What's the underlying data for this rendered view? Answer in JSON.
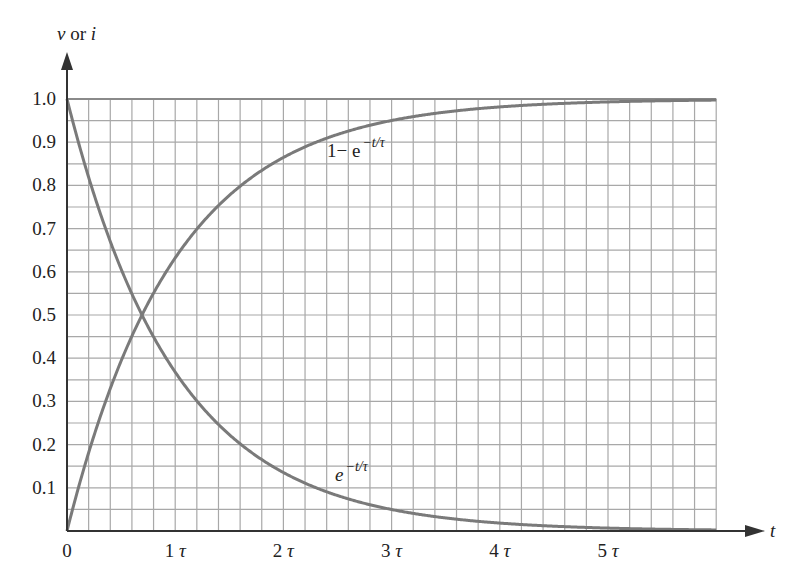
{
  "chart_data": {
    "type": "line",
    "title": "",
    "xlabel": "t",
    "ylabel": "v or i",
    "ylabel_parts": {
      "v": "v",
      "or": " or ",
      "i": "i"
    },
    "xlim": [
      0,
      6
    ],
    "ylim": [
      0,
      1.0
    ],
    "grid": true,
    "grid_x_step": 0.2,
    "grid_y_step": 0.05,
    "x_ticks": [
      {
        "value": 0,
        "label": "0"
      },
      {
        "value": 1,
        "label": "1τ",
        "num": "1",
        "sym": "τ"
      },
      {
        "value": 2,
        "label": "2τ",
        "num": "2",
        "sym": "τ"
      },
      {
        "value": 3,
        "label": "3τ",
        "num": "3",
        "sym": "τ"
      },
      {
        "value": 4,
        "label": "4τ",
        "num": "4",
        "sym": "τ"
      },
      {
        "value": 5,
        "label": "5τ",
        "num": "5",
        "sym": "τ"
      }
    ],
    "y_ticks": [
      {
        "value": 1.0,
        "label": "1.0"
      },
      {
        "value": 0.9,
        "label": "0.9"
      },
      {
        "value": 0.8,
        "label": "0.8"
      },
      {
        "value": 0.7,
        "label": "0.7"
      },
      {
        "value": 0.6,
        "label": "0.6"
      },
      {
        "value": 0.5,
        "label": "0.5"
      },
      {
        "value": 0.4,
        "label": "0.4"
      },
      {
        "value": 0.3,
        "label": "0.3"
      },
      {
        "value": 0.2,
        "label": "0.2"
      },
      {
        "value": 0.1,
        "label": "0.1"
      }
    ],
    "x": [
      0,
      0.5,
      1,
      1.5,
      2,
      2.5,
      3,
      3.5,
      4,
      4.5,
      5,
      5.5,
      6
    ],
    "series": [
      {
        "name": "1 − e^(−t/τ)",
        "label_base": "1− e",
        "label_exp": "−t/τ",
        "formula": "rise",
        "values": [
          0,
          0.393,
          0.632,
          0.777,
          0.865,
          0.918,
          0.95,
          0.97,
          0.982,
          0.989,
          0.993,
          0.996,
          0.998
        ]
      },
      {
        "name": "e^(−t/τ)",
        "label_base": "e",
        "label_exp": "−t/τ",
        "formula": "decay",
        "values": [
          1,
          0.607,
          0.368,
          0.223,
          0.135,
          0.082,
          0.05,
          0.03,
          0.018,
          0.011,
          0.007,
          0.004,
          0.002
        ]
      }
    ],
    "annotations": [
      {
        "text": "1− e^(−t/τ)",
        "x": 2.45,
        "y": 0.88
      },
      {
        "text": "e^(−t/τ)",
        "x": 2.5,
        "y": 0.12
      }
    ],
    "colors": {
      "curve": "#7a7a7a",
      "grid": "#a8a8a8",
      "axis": "#333333"
    }
  }
}
